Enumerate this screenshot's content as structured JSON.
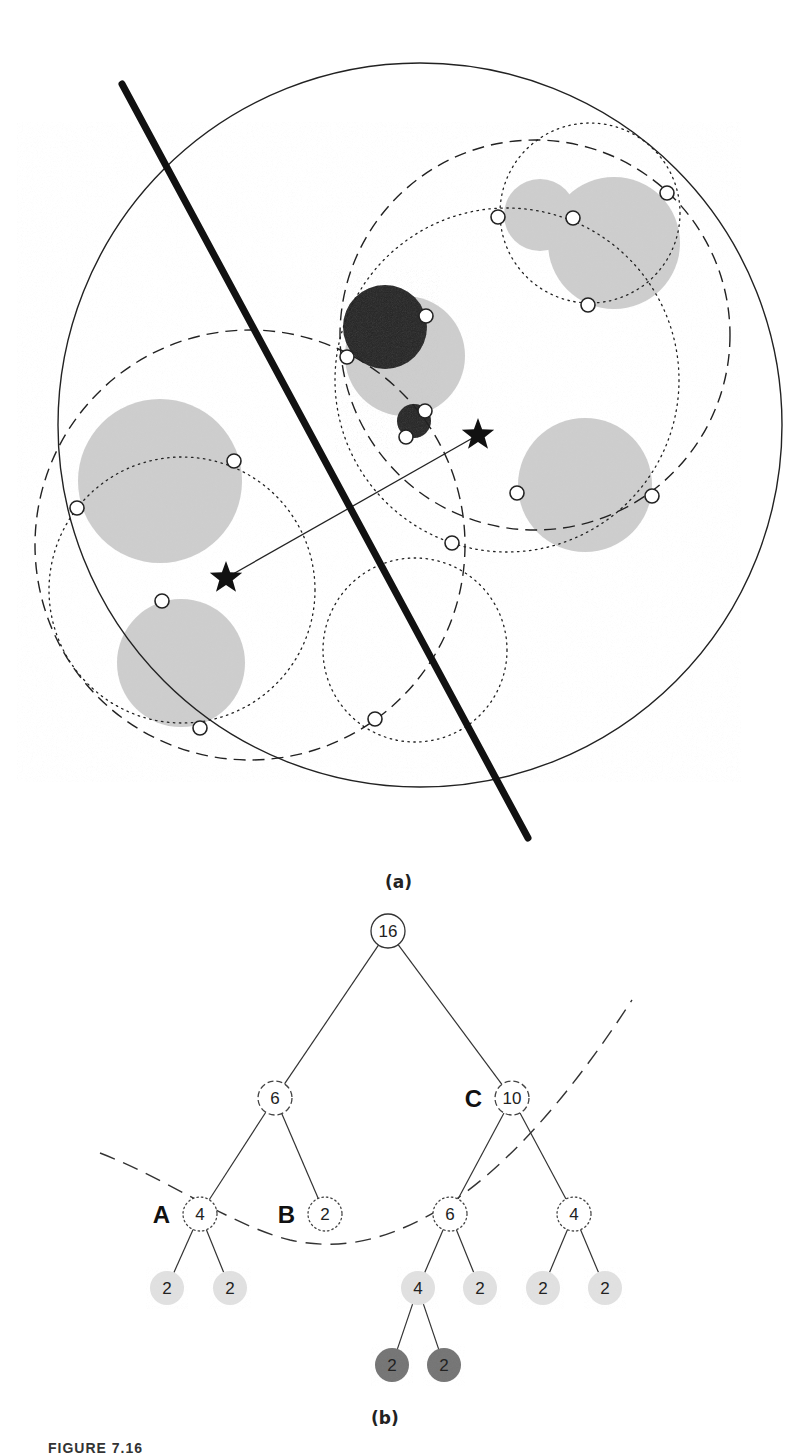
{
  "figure": {
    "panel_a_label": "(a)",
    "panel_b_label": "(b)",
    "caption_partial": "FIGURE 7.16"
  },
  "panel_a": {
    "description": "Ball-tree style spatial partition: outer bounding circle, thick splitting line, dashed and dotted ball boundaries, gray point clusters, two star centroids joined by a line",
    "outer_circle": {
      "cx": 420,
      "cy": 425,
      "r": 362
    },
    "split_line": {
      "x1": 122,
      "y1": 84,
      "x2": 528,
      "y2": 838
    },
    "dashed_circles": [
      {
        "cx": 535,
        "cy": 335,
        "r": 195
      },
      {
        "cx": 250,
        "cy": 545,
        "r": 215
      }
    ],
    "dotted_circles": [
      {
        "cx": 590,
        "cy": 213,
        "r": 90
      },
      {
        "cx": 507,
        "cy": 380,
        "r": 172
      },
      {
        "cx": 182,
        "cy": 590,
        "r": 133
      },
      {
        "cx": 415,
        "cy": 650,
        "r": 92
      }
    ],
    "gray_blobs": [
      {
        "cx": 540,
        "cy": 215,
        "r": 36
      },
      {
        "cx": 614,
        "cy": 243,
        "r": 66
      },
      {
        "cx": 405,
        "cy": 356,
        "r": 60
      },
      {
        "cx": 585,
        "cy": 485,
        "r": 67
      },
      {
        "cx": 160,
        "cy": 481,
        "r": 82
      },
      {
        "cx": 181,
        "cy": 663,
        "r": 64
      }
    ],
    "dark_blobs": [
      {
        "cx": 385,
        "cy": 327,
        "r": 42
      },
      {
        "cx": 414,
        "cy": 421,
        "r": 17
      }
    ],
    "stars": [
      {
        "x": 478,
        "y": 435
      },
      {
        "x": 226,
        "y": 578
      }
    ],
    "points": [
      {
        "x": 498,
        "y": 217
      },
      {
        "x": 573,
        "y": 218
      },
      {
        "x": 667,
        "y": 193
      },
      {
        "x": 588,
        "y": 305
      },
      {
        "x": 426,
        "y": 316
      },
      {
        "x": 347,
        "y": 357
      },
      {
        "x": 425,
        "y": 411
      },
      {
        "x": 406,
        "y": 437
      },
      {
        "x": 517,
        "y": 493
      },
      {
        "x": 652,
        "y": 496
      },
      {
        "x": 452,
        "y": 543
      },
      {
        "x": 234,
        "y": 461
      },
      {
        "x": 77,
        "y": 508
      },
      {
        "x": 162,
        "y": 601
      },
      {
        "x": 200,
        "y": 728
      },
      {
        "x": 375,
        "y": 719
      }
    ]
  },
  "panel_b": {
    "description": "Tree of node counts with a dashed cut curve separating nodes",
    "nodes": [
      {
        "id": "root",
        "value": "16",
        "x": 388,
        "y": 931,
        "style": "solid",
        "letter": ""
      },
      {
        "id": "n6",
        "value": "6",
        "x": 275,
        "y": 1098,
        "style": "dashed",
        "letter": ""
      },
      {
        "id": "n10",
        "value": "10",
        "x": 512,
        "y": 1098,
        "style": "dashed",
        "letter": "C"
      },
      {
        "id": "A",
        "value": "4",
        "x": 200,
        "y": 1214,
        "style": "dotted",
        "letter": "A"
      },
      {
        "id": "B",
        "value": "2",
        "x": 325,
        "y": 1214,
        "style": "dotted",
        "letter": "B"
      },
      {
        "id": "n6b",
        "value": "6",
        "x": 450,
        "y": 1214,
        "style": "dotted",
        "letter": ""
      },
      {
        "id": "n4b",
        "value": "4",
        "x": 574,
        "y": 1214,
        "style": "dotted",
        "letter": ""
      },
      {
        "id": "l1",
        "value": "2",
        "x": 167,
        "y": 1288,
        "style": "light",
        "letter": ""
      },
      {
        "id": "l2",
        "value": "2",
        "x": 230,
        "y": 1288,
        "style": "light",
        "letter": ""
      },
      {
        "id": "l3",
        "value": "4",
        "x": 418,
        "y": 1288,
        "style": "light",
        "letter": ""
      },
      {
        "id": "l4",
        "value": "2",
        "x": 480,
        "y": 1288,
        "style": "light",
        "letter": ""
      },
      {
        "id": "l5",
        "value": "2",
        "x": 543,
        "y": 1288,
        "style": "light",
        "letter": ""
      },
      {
        "id": "l6",
        "value": "2",
        "x": 605,
        "y": 1288,
        "style": "light",
        "letter": ""
      },
      {
        "id": "d1",
        "value": "2",
        "x": 392,
        "y": 1365,
        "style": "dark",
        "letter": ""
      },
      {
        "id": "d2",
        "value": "2",
        "x": 444,
        "y": 1365,
        "style": "dark",
        "letter": ""
      }
    ],
    "edges": [
      [
        "root",
        "n6"
      ],
      [
        "root",
        "n10"
      ],
      [
        "n6",
        "A"
      ],
      [
        "n6",
        "B"
      ],
      [
        "n10",
        "n6b"
      ],
      [
        "n10",
        "n4b"
      ],
      [
        "A",
        "l1"
      ],
      [
        "A",
        "l2"
      ],
      [
        "n6b",
        "l3"
      ],
      [
        "n6b",
        "l4"
      ],
      [
        "n4b",
        "l5"
      ],
      [
        "n4b",
        "l6"
      ],
      [
        "l3",
        "d1"
      ],
      [
        "l3",
        "d2"
      ]
    ]
  },
  "colors": {
    "ink": "#222222",
    "gray_fill": "#cfcfcf",
    "dark_fill": "#3a3a3a",
    "leaf_light": "#e2e2e2",
    "leaf_dark": "#7a7a7a",
    "background": "#ffffff"
  }
}
